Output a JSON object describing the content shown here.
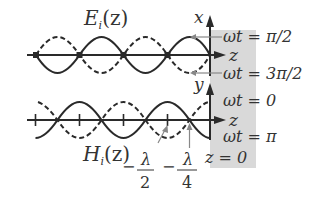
{
  "colors": {
    "background": "#ffffff",
    "stroke": "#2a2a2a",
    "shaded_region": "#d9d9d9",
    "text": "#333333"
  },
  "upper_plot": {
    "label": "E",
    "label_sub": "i",
    "label_arg": "(z)",
    "vertical_axis": "x",
    "horizontal_axis": "z",
    "phase_top": "ωt = π/2",
    "phase_bottom": "ωt = 3π/2"
  },
  "lower_plot": {
    "label": "H",
    "label_sub": "i",
    "label_arg": "(z)",
    "vertical_axis": "y",
    "horizontal_axis": "z",
    "phase_top": "ωt = 0",
    "phase_bottom": "ωt = π"
  },
  "annotations": {
    "half_wavelength": {
      "sign": "−",
      "numerator": "λ",
      "denominator": "2"
    },
    "quarter_wavelength": {
      "sign": "−",
      "numerator": "λ",
      "denominator": "4"
    },
    "origin": "z = 0"
  },
  "legend": {
    "solid": "wave at first phase",
    "dashed": "wave at phase shifted by π"
  }
}
